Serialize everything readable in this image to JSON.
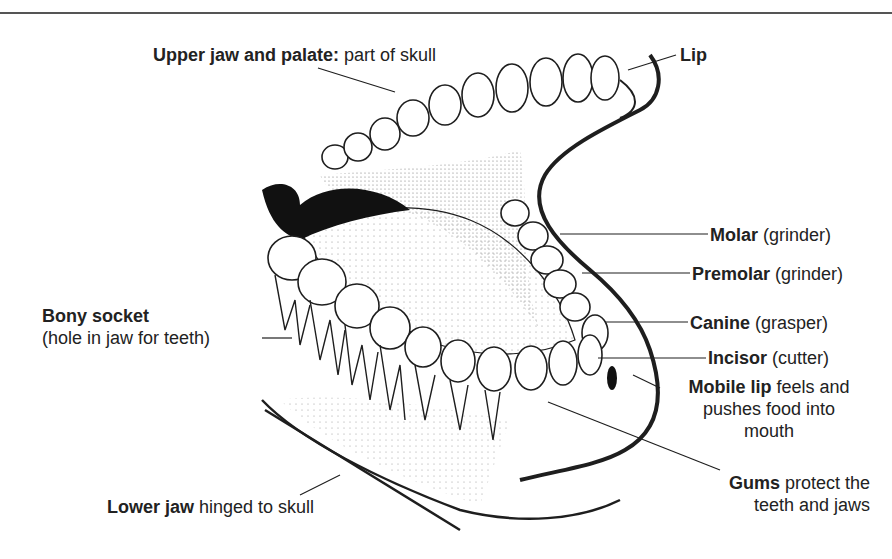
{
  "diagram": {
    "colors": {
      "ink": "#1e1e1e",
      "paper": "#ffffff",
      "rule": "#555555",
      "shade": "#c8c8c8",
      "dark": "#111111"
    },
    "labels": {
      "upper_jaw": {
        "term": "Upper jaw and palate:",
        "desc": " part of skull"
      },
      "lip": {
        "term": "Lip",
        "desc": ""
      },
      "molar": {
        "term": "Molar",
        "desc": " (grinder)"
      },
      "premolar": {
        "term": "Premolar",
        "desc": " (grinder)"
      },
      "canine": {
        "term": "Canine",
        "desc": " (grasper)"
      },
      "incisor": {
        "term": "Incisor",
        "desc": " (cutter)"
      },
      "mobile_lip": {
        "term": "Mobile lip",
        "desc_line1": " feels and",
        "desc_line2": "pushes food into",
        "desc_line3": "mouth"
      },
      "bony_socket": {
        "term": "Bony socket",
        "desc": "(hole in jaw for teeth)"
      },
      "gums": {
        "term": "Gums",
        "desc_line1": " protect the",
        "desc_line2": "teeth and jaws"
      },
      "lower_jaw": {
        "term": "Lower jaw",
        "desc": " hinged to skull"
      }
    }
  }
}
